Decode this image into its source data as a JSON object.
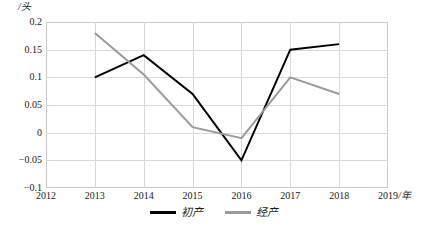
{
  "chart_data": {
    "type": "line",
    "title": "",
    "xlabel": "/年",
    "ylabel": "/头",
    "x": [
      2013,
      2014,
      2015,
      2016,
      2017,
      2018
    ],
    "xlim": [
      2012,
      2019
    ],
    "ylim": [
      -0.1,
      0.2
    ],
    "grid": true,
    "legend_position": "bottom-center",
    "xticks": [
      "2012",
      "2013",
      "2014",
      "2015",
      "2016",
      "2017",
      "2018",
      "2019"
    ],
    "yticks": [
      "0.2",
      "0.15",
      "0.1",
      "0.05",
      "0",
      "-0.05",
      "-0.1"
    ],
    "series": [
      {
        "name": "初产",
        "color": "#000000",
        "values": [
          0.1,
          0.14,
          0.07,
          -0.05,
          0.15,
          0.16
        ]
      },
      {
        "name": "经产",
        "color": "#9a9a9a",
        "values": [
          0.18,
          0.105,
          0.01,
          -0.01,
          0.1,
          0.07
        ]
      }
    ]
  },
  "axes": {
    "y_unit": "/头",
    "x_unit": "/年",
    "y_tick_labels": [
      "0.2",
      "0.15",
      "0.1",
      "0.05",
      "0",
      "-0.05",
      "-0.1"
    ],
    "x_tick_labels": [
      "2012",
      "2013",
      "2014",
      "2015",
      "2016",
      "2017",
      "2018",
      "2019"
    ]
  },
  "legend": {
    "items": [
      {
        "label": "初产",
        "color": "#000000"
      },
      {
        "label": "经产",
        "color": "#9a9a9a"
      }
    ]
  }
}
